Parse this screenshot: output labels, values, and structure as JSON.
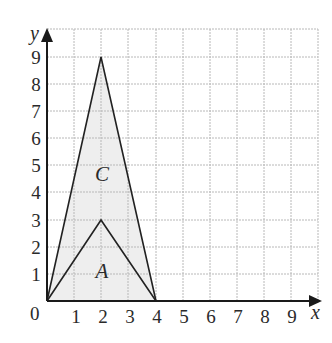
{
  "diagram": {
    "type": "coordinate-grid",
    "axes": {
      "x_label": "x",
      "y_label": "y",
      "origin_label": "0",
      "x_ticks": [
        "1",
        "2",
        "3",
        "4",
        "5",
        "6",
        "7",
        "8",
        "9"
      ],
      "y_ticks": [
        "1",
        "2",
        "3",
        "4",
        "5",
        "6",
        "7",
        "8",
        "9"
      ],
      "range": [
        0,
        10
      ]
    },
    "shapes": [
      {
        "name": "C",
        "label": "C",
        "vertices": [
          [
            0,
            0
          ],
          [
            2,
            9
          ],
          [
            4,
            0
          ]
        ],
        "label_pos": [
          2,
          4.5
        ]
      },
      {
        "name": "A",
        "label": "A",
        "vertices": [
          [
            0,
            0
          ],
          [
            2,
            3
          ],
          [
            4,
            0
          ]
        ],
        "label_pos": [
          2,
          1.1
        ]
      }
    ],
    "colors": {
      "grid": "#b8b8b8",
      "axis": "#1a1a1a",
      "fill": "#eeeeee",
      "stroke": "#222222"
    }
  }
}
